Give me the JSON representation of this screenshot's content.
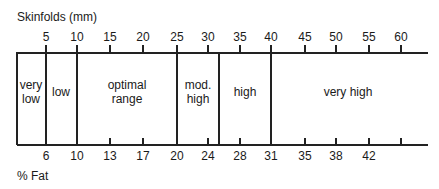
{
  "top_axis": {
    "title": "Skinfolds (mm)",
    "ticks": [
      {
        "label": "5",
        "x": 46
      },
      {
        "label": "10",
        "x": 77
      },
      {
        "label": "15",
        "x": 110
      },
      {
        "label": "20",
        "x": 143
      },
      {
        "label": "25",
        "x": 177
      },
      {
        "label": "30",
        "x": 208
      },
      {
        "label": "35",
        "x": 240
      },
      {
        "label": "40",
        "x": 271
      },
      {
        "label": "45",
        "x": 305
      },
      {
        "label": "50",
        "x": 336
      },
      {
        "label": "55",
        "x": 369
      },
      {
        "label": "60",
        "x": 401
      }
    ]
  },
  "bottom_axis": {
    "title": "% Fat",
    "ticks": [
      {
        "label": "6",
        "x": 46
      },
      {
        "label": "10",
        "x": 77
      },
      {
        "label": "13",
        "x": 110
      },
      {
        "label": "17",
        "x": 143
      },
      {
        "label": "20",
        "x": 177
      },
      {
        "label": "24",
        "x": 208
      },
      {
        "label": "28",
        "x": 240
      },
      {
        "label": "31",
        "x": 271
      },
      {
        "label": "35",
        "x": 305
      },
      {
        "label": "38",
        "x": 336
      },
      {
        "label": "42",
        "x": 369
      },
      {
        "label": "",
        "x": 401
      }
    ]
  },
  "zones": [
    {
      "line1": "very",
      "line2": "low",
      "x": 31
    },
    {
      "line1": "low",
      "line2": "",
      "x": 61
    },
    {
      "line1": "optimal",
      "line2": "range",
      "x": 127
    },
    {
      "line1": "mod.",
      "line2": "high",
      "x": 198
    },
    {
      "line1": "high",
      "line2": "",
      "x": 245
    },
    {
      "line1": "very high",
      "line2": "",
      "x": 348
    }
  ],
  "dividers": [
    17,
    46,
    77,
    177,
    219,
    271
  ]
}
